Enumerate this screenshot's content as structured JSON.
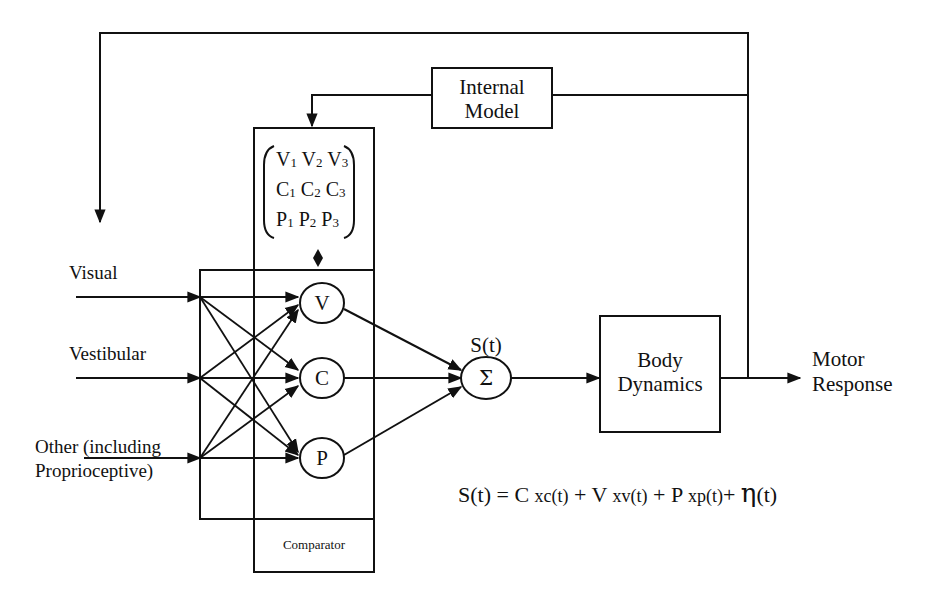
{
  "diagram": {
    "type": "block-diagram",
    "title": "",
    "inputs": [
      {
        "id": "visual",
        "label": "Visual"
      },
      {
        "id": "vestibular",
        "label": "Vestibular"
      },
      {
        "id": "other",
        "label_line1": "Other (including",
        "label_line2": "Proprioceptive)"
      }
    ],
    "weights": [
      {
        "id": "V",
        "label": "V"
      },
      {
        "id": "C",
        "label": "C"
      },
      {
        "id": "P",
        "label": "P"
      }
    ],
    "matrix": {
      "rows": [
        [
          {
            "b": "V",
            "s": "1"
          },
          {
            "b": "V",
            "s": "2"
          },
          {
            "b": "V",
            "s": "3"
          }
        ],
        [
          {
            "b": "C",
            "s": "1"
          },
          {
            "b": "C",
            "s": "2"
          },
          {
            "b": "C",
            "s": "3"
          }
        ],
        [
          {
            "b": "P",
            "s": "1"
          },
          {
            "b": "P",
            "s": "2"
          },
          {
            "b": "P",
            "s": "3"
          }
        ]
      ]
    },
    "comparator": {
      "label": "Comparator"
    },
    "internal_model": {
      "line1": "Internal",
      "line2": "Model"
    },
    "sum": {
      "symbol": "Σ",
      "signal_label": "S(t)"
    },
    "body_dynamics": {
      "line1": "Body",
      "line2": "Dynamics"
    },
    "output": {
      "line1": "Motor",
      "line2": "Response"
    },
    "equation": {
      "lhs": "S(t) = C ",
      "t1": "xc(t)",
      "plus1": " + V ",
      "t2": "xv(t)",
      "plus2": " + P ",
      "t3": "xp(t)",
      "plus3": "+ ",
      "eta": "η",
      "eta_arg": "(t)"
    },
    "colors": {
      "line": "#111111",
      "background": "#ffffff"
    }
  }
}
